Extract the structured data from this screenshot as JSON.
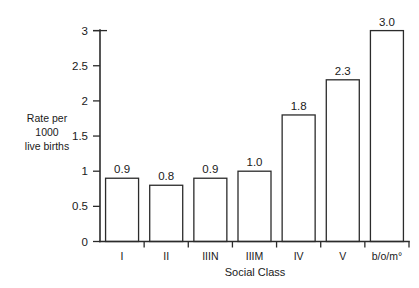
{
  "chart_data": {
    "type": "bar",
    "title": "",
    "subtitle": "",
    "xlabel": "Social Class",
    "ylabel": "Rate per 1000 live births",
    "ylabel_lines": [
      "Rate per",
      "1000",
      "live births"
    ],
    "categories": [
      "I",
      "II",
      "IIIN",
      "IIIM",
      "IV",
      "V",
      "b/o/m°"
    ],
    "values": [
      0.9,
      0.8,
      0.9,
      1.0,
      1.8,
      2.3,
      3.0
    ],
    "value_labels": [
      "0.9",
      "0.8",
      "0.9",
      "1.0",
      "1.8",
      "2.3",
      "3.0"
    ],
    "ylim": [
      0,
      3
    ],
    "yticks": [
      0,
      0.5,
      1,
      1.5,
      2,
      2.5,
      3
    ],
    "ytick_labels": [
      "0",
      "0.5",
      "1",
      "1.5",
      "2",
      "2.5",
      "3"
    ],
    "grid": false,
    "legend": null,
    "legend_position": "none",
    "bar_fill": "#ffffff",
    "bar_edge_color": "#2b2b2b",
    "bar_hatch": "diagonal-up",
    "axis_color": "#2b2b2b",
    "background": "#ffffff",
    "annotations": []
  },
  "chart": {
    "value_label_prefix": "",
    "x_axis_title": "Social Class"
  }
}
